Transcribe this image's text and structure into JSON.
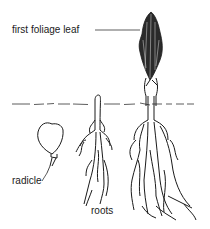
{
  "diagram": {
    "labels": {
      "leaf": "first foliage leaf",
      "radicle": "radicle",
      "roots": "roots"
    },
    "stages": [
      {
        "id": "seed",
        "description": "seed with emerging radicle"
      },
      {
        "id": "young-seedling",
        "description": "coleoptile emerging with roots"
      },
      {
        "id": "seedling",
        "description": "seedling with first foliage leaf and branched roots"
      }
    ],
    "colors": {
      "ink": "#1a1a1a",
      "leaf_fill": "#2a2a2a",
      "background": "#ffffff"
    }
  }
}
